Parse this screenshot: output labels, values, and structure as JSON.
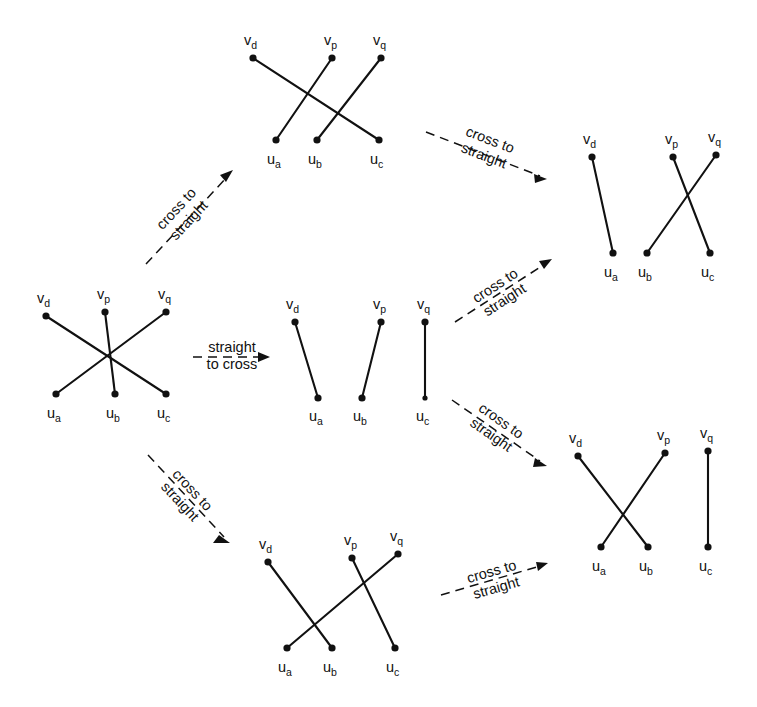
{
  "figure": {
    "ink_color": "#111111",
    "background_color": "#ffffff",
    "width": 757,
    "height": 707
  },
  "vertex_labels": {
    "vd": {
      "base": "v",
      "sub": "d"
    },
    "vp": {
      "base": "v",
      "sub": "p"
    },
    "vq": {
      "base": "v",
      "sub": "q"
    },
    "ua": {
      "base": "u",
      "sub": "a"
    },
    "ub": {
      "base": "u",
      "sub": "b"
    },
    "uc": {
      "base": "u",
      "sub": "c"
    }
  },
  "arrow_labels": {
    "cross_to_straight_line1": "cross to",
    "cross_to_straight_line2": "straight",
    "straight_to_cross_line1": "straight",
    "straight_to_cross_line2": "to cross"
  },
  "graphs": [
    {
      "id": "left-center",
      "name": "graph-left-center",
      "description": "fully crossing matching",
      "top_vertices": [
        "vd",
        "vp",
        "vq"
      ],
      "bottom_vertices": [
        "ua",
        "ub",
        "uc"
      ],
      "edges": [
        {
          "from": "vd",
          "to": "uc"
        },
        {
          "from": "vp",
          "to": "ub"
        },
        {
          "from": "vq",
          "to": "ua"
        }
      ]
    },
    {
      "id": "top-middle",
      "name": "graph-top-middle",
      "description": "partially crossing matching",
      "top_vertices": [
        "vd",
        "vp",
        "vq"
      ],
      "bottom_vertices": [
        "ua",
        "ub",
        "uc"
      ],
      "edges": [
        {
          "from": "vd",
          "to": "uc"
        },
        {
          "from": "vp",
          "to": "ua"
        },
        {
          "from": "vq",
          "to": "ub"
        }
      ]
    },
    {
      "id": "center-middle",
      "name": "graph-center-middle",
      "description": "straight (non-crossing) matching",
      "top_vertices": [
        "vd",
        "vp",
        "vq"
      ],
      "bottom_vertices": [
        "ua",
        "ub",
        "uc"
      ],
      "edges": [
        {
          "from": "vd",
          "to": "ua"
        },
        {
          "from": "vp",
          "to": "ub"
        },
        {
          "from": "vq",
          "to": "uc"
        }
      ]
    },
    {
      "id": "bottom-middle",
      "name": "graph-bottom-middle",
      "description": "partially crossing matching",
      "top_vertices": [
        "vd",
        "vp",
        "vq"
      ],
      "bottom_vertices": [
        "ua",
        "ub",
        "uc"
      ],
      "edges": [
        {
          "from": "vd",
          "to": "ub"
        },
        {
          "from": "vp",
          "to": "uc"
        },
        {
          "from": "vq",
          "to": "ua"
        }
      ]
    },
    {
      "id": "top-right",
      "name": "graph-top-right",
      "description": "one straight edge plus one crossing pair",
      "top_vertices": [
        "vd",
        "vp",
        "vq"
      ],
      "bottom_vertices": [
        "ua",
        "ub",
        "uc"
      ],
      "edges": [
        {
          "from": "vd",
          "to": "ua"
        },
        {
          "from": "vp",
          "to": "uc"
        },
        {
          "from": "vq",
          "to": "ub"
        }
      ]
    },
    {
      "id": "bottom-right",
      "name": "graph-bottom-right",
      "description": "one crossing pair plus one straight edge",
      "top_vertices": [
        "vd",
        "vp",
        "vq"
      ],
      "bottom_vertices": [
        "ua",
        "ub",
        "uc"
      ],
      "edges": [
        {
          "from": "vd",
          "to": "ub"
        },
        {
          "from": "vp",
          "to": "ua"
        },
        {
          "from": "vq",
          "to": "uc"
        }
      ]
    }
  ],
  "arrows": [
    {
      "id": "arrow-left-to-top",
      "name": "arrow-cross-to-straight-left-to-top",
      "label_line1": "cross to",
      "label_line2": "straight",
      "direction": "up-right"
    },
    {
      "id": "arrow-top-to-topright",
      "name": "arrow-cross-to-straight-top-to-topright",
      "label_line1": "cross to",
      "label_line2": "straight",
      "direction": "down-right"
    },
    {
      "id": "arrow-left-to-center",
      "name": "arrow-straight-to-cross-left-to-center",
      "label_line1": "straight",
      "label_line2": "to cross",
      "direction": "right"
    },
    {
      "id": "arrow-center-to-topright",
      "name": "arrow-cross-to-straight-center-to-topright",
      "label_line1": "cross to",
      "label_line2": "straight",
      "direction": "up-right"
    },
    {
      "id": "arrow-center-to-bottomright",
      "name": "arrow-cross-to-straight-center-to-bottomright",
      "label_line1": "cross to",
      "label_line2": "straight",
      "direction": "down-right"
    },
    {
      "id": "arrow-left-to-bottom",
      "name": "arrow-cross-to-straight-left-to-bottom",
      "label_line1": "cross to",
      "label_line2": "straight",
      "direction": "down-right"
    },
    {
      "id": "arrow-bottom-to-bottomright",
      "name": "arrow-cross-to-straight-bottom-to-bottomright",
      "label_line1": "cross to",
      "label_line2": "straight",
      "direction": "up-right"
    }
  ]
}
